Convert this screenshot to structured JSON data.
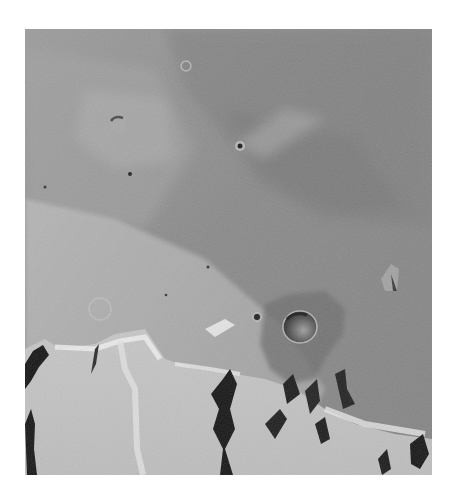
{
  "image": {
    "subject": "Grayscale orbital photograph of cratered planetary surface with escarpments",
    "frame": {
      "x": 25,
      "y": 29,
      "width": 407,
      "height": 446
    },
    "palette": {
      "background": "#ffffff",
      "dark_plain": "#7e7e7e",
      "mid_plain": "#8e8e8e",
      "light_plain": "#b4b4b4",
      "bright_scarp": "#d8d8d8",
      "shadow": "#1c1c1c"
    },
    "features": [
      {
        "name": "large-crater",
        "cx": 275,
        "cy": 298,
        "r": 16
      },
      {
        "name": "small-crater-dark-center",
        "cx": 215,
        "cy": 117,
        "r": 3
      },
      {
        "name": "crater-upper-left",
        "cx": 93,
        "cy": 96,
        "r": 8
      },
      {
        "name": "crater-top-ring",
        "cx": 161,
        "cy": 37,
        "r": 5
      },
      {
        "name": "small-pit",
        "cx": 105,
        "cy": 145,
        "r": 2
      },
      {
        "name": "small-pit-2",
        "cx": 232,
        "cy": 288,
        "r": 3
      },
      {
        "name": "mesa-right",
        "cx": 365,
        "cy": 247,
        "r": 9
      },
      {
        "name": "ghost-crater",
        "cx": 75,
        "cy": 280,
        "r": 11
      }
    ]
  }
}
